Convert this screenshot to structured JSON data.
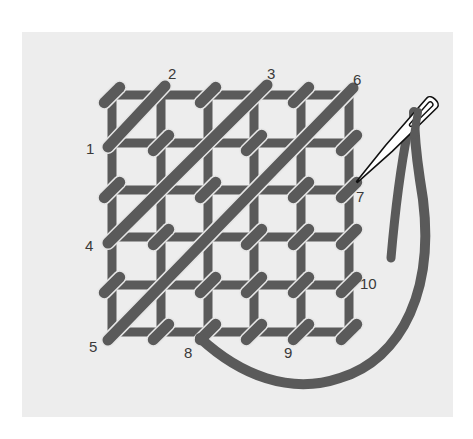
{
  "diagram": {
    "colors": {
      "background": "#ffffff",
      "panel": "#ededed",
      "thread": "#5a5a5a",
      "outline": "#e6e6e6",
      "needle_fill": "#ffffff",
      "needle_stroke": "#111111",
      "label": "#3a3a3a"
    },
    "grid": {
      "columns_x": [
        112,
        161,
        208,
        254,
        301,
        349
      ],
      "rows_y": [
        95,
        143,
        190,
        237,
        285,
        332
      ]
    },
    "diagonals": [
      {
        "from_label": "1",
        "to_label": "2",
        "x1": 108,
        "y1": 147,
        "x2": 165,
        "y2": 86
      },
      {
        "from_label": "4",
        "to_label": "3",
        "x1": 108,
        "y1": 243,
        "x2": 267,
        "y2": 85
      },
      {
        "from_label": "5",
        "to_label": "6",
        "x1": 108,
        "y1": 340,
        "x2": 353,
        "y2": 88
      }
    ],
    "couching_stitches": [
      [
        112,
        95
      ],
      [
        208,
        95
      ],
      [
        301,
        95
      ],
      [
        161,
        143
      ],
      [
        254,
        143
      ],
      [
        349,
        143
      ],
      [
        112,
        190
      ],
      [
        208,
        190
      ],
      [
        301,
        190
      ],
      [
        349,
        190
      ],
      [
        161,
        237
      ],
      [
        254,
        237
      ],
      [
        301,
        237
      ],
      [
        349,
        237
      ],
      [
        112,
        285
      ],
      [
        208,
        285
      ],
      [
        254,
        285
      ],
      [
        301,
        285
      ],
      [
        349,
        285
      ],
      [
        161,
        332
      ],
      [
        208,
        332
      ],
      [
        254,
        332
      ],
      [
        301,
        332
      ],
      [
        349,
        332
      ]
    ],
    "labels": [
      {
        "text": "1",
        "x": 86,
        "y": 154
      },
      {
        "text": "2",
        "x": 168,
        "y": 79
      },
      {
        "text": "3",
        "x": 267,
        "y": 79
      },
      {
        "text": "6",
        "x": 353,
        "y": 85
      },
      {
        "text": "4",
        "x": 85,
        "y": 251
      },
      {
        "text": "7",
        "x": 356,
        "y": 202
      },
      {
        "text": "10",
        "x": 360,
        "y": 289
      },
      {
        "text": "5",
        "x": 89,
        "y": 352
      },
      {
        "text": "8",
        "x": 184,
        "y": 358
      },
      {
        "text": "9",
        "x": 284,
        "y": 358
      }
    ],
    "working_thread": "M200 338 C 240 375, 290 395, 340 378 C 400 360, 440 290, 420 180 C 414 140, 414 120, 414 112",
    "thread_tail": "M 408 130 C 402 160, 396 200, 391 258",
    "needle": {
      "eye_x": 428,
      "eye_y": 107,
      "tip_x": 357,
      "tip_y": 182
    }
  }
}
